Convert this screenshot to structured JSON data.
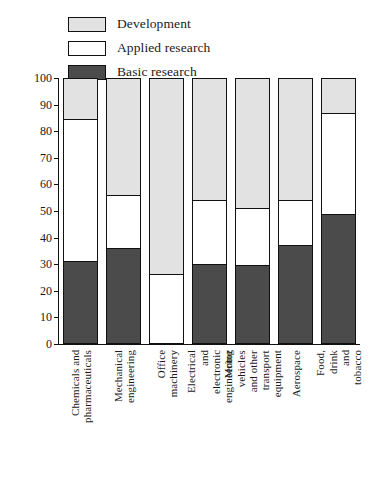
{
  "chart_data": {
    "type": "bar",
    "subtype": "stacked-bar-100",
    "title": "",
    "xlabel": "",
    "ylabel": "Percentage",
    "ylim": [
      0,
      100
    ],
    "ytick_step": 10,
    "yticks": [
      0,
      10,
      20,
      30,
      40,
      50,
      60,
      70,
      80,
      90,
      100
    ],
    "grid": false,
    "legend_position": "top-left",
    "categories": [
      "Chemicals and pharmaceuticals",
      "Mechanical engineering",
      "Office machinery",
      "Electrical and electronic engineering",
      "Motor vehicles and other transport equipment",
      "Aerospace",
      "Food, drink and tobacco"
    ],
    "series": [
      {
        "name": "Development",
        "color": "#e2e2e2",
        "values": [
          15,
          44,
          74,
          46,
          49,
          46,
          13
        ]
      },
      {
        "name": "Applied research",
        "color": "#ffffff",
        "values": [
          54,
          20,
          26,
          24,
          21.5,
          17,
          38
        ]
      },
      {
        "name": "Basic research",
        "color": "#4b4b4b",
        "values": [
          31,
          36,
          0,
          30,
          29.5,
          37,
          49
        ]
      }
    ],
    "cumulative_tops": {
      "development_top": [
        100,
        100,
        100,
        100,
        100,
        100,
        100
      ],
      "applied_top": [
        85,
        56,
        26,
        54,
        51,
        54,
        87
      ],
      "basic_top": [
        31,
        36,
        0,
        30,
        29.5,
        37,
        49
      ]
    }
  },
  "legend": {
    "items": [
      {
        "label": "Development",
        "color": "#e2e2e2"
      },
      {
        "label": "Applied research",
        "color": "#ffffff"
      },
      {
        "label": "Basic research",
        "color": "#4b4b4b"
      }
    ]
  },
  "axis": {
    "y_title": "Percentage",
    "y_tick_labels": [
      "100",
      "90",
      "80",
      "70",
      "60",
      "50",
      "40",
      "30",
      "20",
      "10",
      "0"
    ]
  },
  "x_tick_labels": [
    "Chemicals and\npharmaceuticals",
    "Mechanical\nengineering",
    "Office\nmachinery",
    "Electrical and\nelectronic\nengineering",
    "Motor vehicles and other\ntransport equipment",
    "Aerospace",
    "Food, drink\nand tobacco"
  ]
}
